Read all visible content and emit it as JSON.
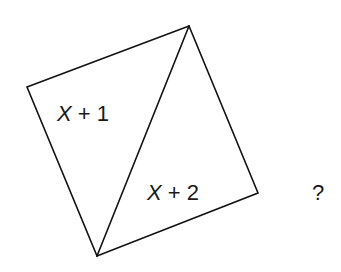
{
  "figure": {
    "type": "geometry-diagram",
    "shape": "square rotated, divided by diagonal into two triangles",
    "vertices": {
      "left": [
        27,
        87
      ],
      "top": [
        189,
        26
      ],
      "right": [
        258,
        193
      ],
      "bottom": [
        97,
        256
      ]
    },
    "diagonal": {
      "from": "top",
      "to": "bottom"
    },
    "regions": [
      {
        "name": "upper-left-triangle",
        "label_var": "X",
        "label_rest": " + 1",
        "label_full": "X + 1"
      },
      {
        "name": "lower-right-triangle",
        "label_var": "X",
        "label_rest": " + 2",
        "label_full": "X + 2"
      }
    ],
    "question_mark": "?",
    "colors": {
      "stroke": "#111111",
      "text": "#1a1a1a",
      "background": "#ffffff"
    }
  }
}
